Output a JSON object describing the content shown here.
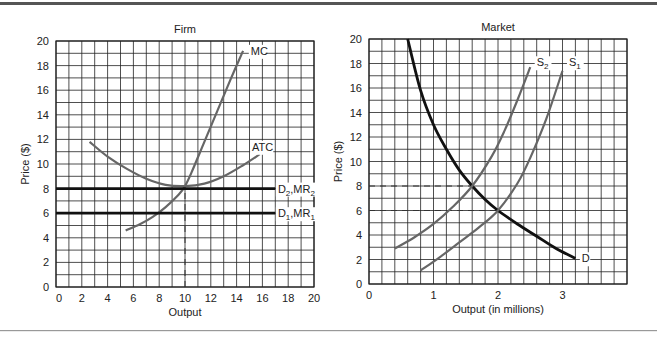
{
  "chart_data": [
    {
      "type": "line",
      "title": "Firm",
      "xlabel": "Output",
      "ylabel": "Price ($)",
      "xlim": [
        0,
        20
      ],
      "ylim": [
        0,
        20
      ],
      "xticks": [
        0,
        2,
        4,
        6,
        8,
        10,
        12,
        14,
        16,
        18,
        20
      ],
      "yticks": [
        0,
        2,
        4,
        6,
        8,
        10,
        12,
        14,
        16,
        18,
        20
      ],
      "grid": true,
      "grid_step_x": 1,
      "grid_step_y": 1,
      "series": [
        {
          "name": "MC",
          "label": "MC",
          "color": "#666666",
          "width": 2.2,
          "x": [
            5.4,
            6.5,
            7.5,
            8.5,
            9.5,
            10.0,
            10.5,
            11.5,
            12.5,
            13.5,
            14.5
          ],
          "y": [
            4.6,
            5.1,
            5.7,
            6.5,
            7.5,
            8.2,
            9.3,
            11.8,
            14.3,
            16.8,
            19.2
          ]
        },
        {
          "name": "ATC",
          "label": "ATC",
          "color": "#666666",
          "width": 2.2,
          "x": [
            2.6,
            4.0,
            5.5,
            7.0,
            8.5,
            10.0,
            11.5,
            13.0,
            14.5,
            15.8
          ],
          "y": [
            11.8,
            10.6,
            9.6,
            8.8,
            8.3,
            8.2,
            8.4,
            9.0,
            9.9,
            10.8
          ]
        },
        {
          "name": "D2,MR2",
          "label": "D",
          "sub": "2",
          "label2": ",MR",
          "sub2": "2",
          "color": "#111111",
          "width": 2.8,
          "x": [
            0,
            17
          ],
          "y": [
            8,
            8
          ]
        },
        {
          "name": "D1,MR1",
          "label": "D",
          "sub": "1",
          "label2": ",MR",
          "sub2": "1",
          "color": "#111111",
          "width": 2.8,
          "x": [
            0,
            17
          ],
          "y": [
            6,
            6
          ]
        }
      ],
      "reference_lines": [
        {
          "type": "vertical-dashed",
          "x": 10,
          "y_from": 0,
          "y_to": 8
        }
      ],
      "annotations": [
        {
          "text": "MC",
          "x": 15.1,
          "y": 19.2
        },
        {
          "text": "ATC",
          "x": 15.2,
          "y": 11.4
        },
        {
          "text": "D2,MR2",
          "x": 17.2,
          "y": 8
        },
        {
          "text": "D1,MR1",
          "x": 17.2,
          "y": 6
        }
      ]
    },
    {
      "type": "line",
      "title": "Market",
      "xlabel": "Output (in millions)",
      "ylabel": "Price ($)",
      "xlim": [
        0,
        4
      ],
      "ylim": [
        0,
        20
      ],
      "xticks": [
        0,
        1,
        2,
        3
      ],
      "yticks": [
        0,
        2,
        4,
        6,
        8,
        10,
        12,
        14,
        16,
        18,
        20
      ],
      "grid": true,
      "grid_step_x": 0.2,
      "grid_step_y": 1,
      "series": [
        {
          "name": "D",
          "label": "D",
          "color": "#111111",
          "width": 2.8,
          "x": [
            0.6,
            0.8,
            1.0,
            1.2,
            1.4,
            1.6,
            1.8,
            2.0,
            2.3,
            2.6,
            2.9,
            3.2
          ],
          "y": [
            20.0,
            15.8,
            13.0,
            11.0,
            9.3,
            8.0,
            6.9,
            6.0,
            4.9,
            3.9,
            2.9,
            2.1
          ]
        },
        {
          "name": "S2",
          "label": "S",
          "sub": "2",
          "color": "#666666",
          "width": 2.2,
          "x": [
            0.4,
            0.7,
            1.0,
            1.3,
            1.6,
            1.9,
            2.1,
            2.3,
            2.5
          ],
          "y": [
            2.9,
            3.8,
            4.9,
            6.3,
            8.0,
            10.4,
            12.5,
            15.0,
            17.7
          ]
        },
        {
          "name": "S1",
          "label": "S",
          "sub": "1",
          "color": "#666666",
          "width": 2.2,
          "x": [
            0.8,
            1.1,
            1.4,
            1.7,
            2.0,
            2.3,
            2.5,
            2.75,
            3.0
          ],
          "y": [
            1.1,
            2.2,
            3.4,
            4.6,
            6.0,
            8.2,
            10.3,
            13.5,
            17.4
          ]
        }
      ],
      "reference_lines": [
        {
          "type": "horizontal-dashed",
          "y": 8,
          "x_from": 0,
          "x_to": 1.6
        },
        {
          "type": "horizontal-dashed",
          "y": 6,
          "x_from": 0,
          "x_to": 2.0
        }
      ],
      "annotations": [
        {
          "text": "S2",
          "x": 2.6,
          "y": 18.1
        },
        {
          "text": "S1",
          "x": 3.1,
          "y": 18.1
        },
        {
          "text": "D",
          "x": 3.3,
          "y": 2.1
        }
      ]
    }
  ],
  "layout": {
    "top_rule_y": 4,
    "bottom_rule_y": 330,
    "panels": [
      {
        "left": 56,
        "top": 41,
        "right": 314,
        "bottom": 287
      },
      {
        "left": 369,
        "top": 39,
        "right": 627,
        "bottom": 284
      }
    ]
  }
}
